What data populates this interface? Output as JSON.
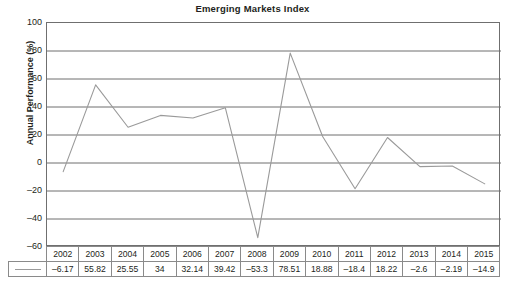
{
  "chart_data": {
    "type": "line",
    "title": "Emerging Markets Index",
    "xlabel": "",
    "ylabel": "Annual Performance (%)",
    "ylim": [
      -60,
      100
    ],
    "yticks": [
      100,
      80,
      60,
      40,
      20,
      0,
      -20,
      -40,
      -60
    ],
    "ytick_labels": [
      "100",
      "80",
      "60",
      "40",
      "20",
      "0",
      "–20",
      "–40",
      "–60"
    ],
    "grid": true,
    "legend": "none",
    "categories": [
      "2002",
      "2003",
      "2004",
      "2005",
      "2006",
      "2007",
      "2008",
      "2009",
      "2010",
      "2011",
      "2012",
      "2013",
      "2014",
      "2015"
    ],
    "values": [
      -6.17,
      55.82,
      25.55,
      34,
      32.14,
      39.42,
      -53.3,
      78.51,
      18.88,
      -18.4,
      18.22,
      -2.6,
      -2.19,
      -14.9
    ],
    "value_labels": [
      "–6.17",
      "55.82",
      "25.55",
      "34",
      "32.14",
      "39.42",
      "–53.3",
      "78.51",
      "18.88",
      "–18.4",
      "18.22",
      "–2.6",
      "–2.19",
      "–14.9"
    ],
    "series_color": "#9a9a9a",
    "grid_color": "#6f6f6f",
    "axis_color": "#6f6f6f"
  },
  "table": {
    "legend_swatch_name": "series-line-swatch",
    "header_row": [
      "2002",
      "2003",
      "2004",
      "2005",
      "2006",
      "2007",
      "2008",
      "2009",
      "2010",
      "2011",
      "2012",
      "2013",
      "2014",
      "2015"
    ],
    "value_row": [
      "–6.17",
      "55.82",
      "25.55",
      "34",
      "32.14",
      "39.42",
      "–53.3",
      "78.51",
      "18.88",
      "–18.4",
      "18.22",
      "–2.6",
      "–2.19",
      "–14.9"
    ]
  }
}
